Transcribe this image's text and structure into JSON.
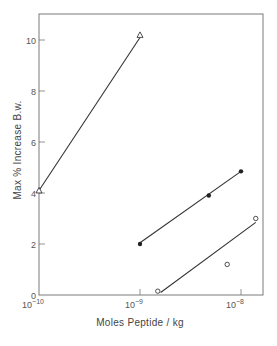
{
  "chart_data": {
    "type": "scatter",
    "title": "",
    "xlabel": "Moles Peptide / kg",
    "ylabel": "Max % Increase B.w.",
    "xscale": "log",
    "xlim": [
      1e-10,
      1.6e-08
    ],
    "ylim": [
      0,
      11
    ],
    "x_ticks": [
      {
        "value": 1e-10,
        "base": "10",
        "exp": "-10"
      },
      {
        "value": 1e-09,
        "base": "10",
        "exp": "-9"
      },
      {
        "value": 1e-08,
        "base": "10",
        "exp": "-8"
      }
    ],
    "y_ticks": [
      0,
      2,
      4,
      6,
      8,
      10
    ],
    "grid": false,
    "legend": null,
    "series": [
      {
        "name": "open-triangle",
        "marker": "triangle-open",
        "points": [
          {
            "x": 1e-10,
            "y": 4.1
          },
          {
            "x": 1e-09,
            "y": 10.2
          }
        ],
        "fit_line": [
          {
            "x": 1e-10,
            "y": 4.1
          },
          {
            "x": 1e-09,
            "y": 10.1
          }
        ]
      },
      {
        "name": "filled-circle",
        "marker": "circle-filled",
        "points": [
          {
            "x": 1e-09,
            "y": 2.0
          },
          {
            "x": 4.8e-09,
            "y": 3.9
          },
          {
            "x": 1e-08,
            "y": 4.85
          }
        ],
        "fit_line": [
          {
            "x": 1e-09,
            "y": 2.05
          },
          {
            "x": 1e-08,
            "y": 4.85
          }
        ]
      },
      {
        "name": "open-circle",
        "marker": "circle-open",
        "points": [
          {
            "x": 1.5e-09,
            "y": 0.15
          },
          {
            "x": 7.3e-09,
            "y": 1.2
          },
          {
            "x": 1.4e-08,
            "y": 3.0
          }
        ],
        "fit_line": [
          {
            "x": 1.6e-09,
            "y": 0.1
          },
          {
            "x": 1.4e-08,
            "y": 2.85
          }
        ]
      }
    ]
  },
  "layout": {
    "plot": {
      "left": 39,
      "top": 14,
      "right": 263,
      "bottom": 295
    },
    "x_decade_px": 101,
    "x_origin_px": 39,
    "y_unit_px": 25.5,
    "y_origin_px": 295
  },
  "colors": {
    "axis": "#777777",
    "line": "#333333",
    "marker": "#222222",
    "text": "#555555"
  }
}
